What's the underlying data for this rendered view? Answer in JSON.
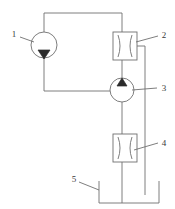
{
  "diagram": {
    "background_color": "#ffffff",
    "line_color": "#6f6f6f",
    "fill_color": "#2b2b2b",
    "label_color": "#3a3a3a",
    "callouts": [
      {
        "id": "1",
        "label": "1",
        "refers_to": "pump-circle-top-left"
      },
      {
        "id": "2",
        "label": "2",
        "refers_to": "nozzle-box-upper"
      },
      {
        "id": "3",
        "label": "3",
        "refers_to": "pump-circle-center"
      },
      {
        "id": "4",
        "label": "4",
        "refers_to": "nozzle-box-lower"
      },
      {
        "id": "5",
        "label": "5",
        "refers_to": "tank-vessel"
      }
    ],
    "components": [
      {
        "name": "pump-circle-top-left",
        "type": "circle-with-down-triangle",
        "cx": 44,
        "cy": 45,
        "r": 13
      },
      {
        "name": "nozzle-box-upper",
        "type": "venturi-box",
        "x": 113,
        "y": 32,
        "w": 24,
        "h": 28
      },
      {
        "name": "pump-circle-center",
        "type": "circle-with-up-triangle",
        "cx": 122,
        "cy": 90,
        "r": 12
      },
      {
        "name": "nozzle-box-lower",
        "type": "venturi-box",
        "x": 113,
        "y": 134,
        "w": 24,
        "h": 28
      },
      {
        "name": "tank-vessel",
        "type": "open-top-tank",
        "x": 99,
        "y": 181,
        "w": 60,
        "h": 22
      }
    ]
  }
}
